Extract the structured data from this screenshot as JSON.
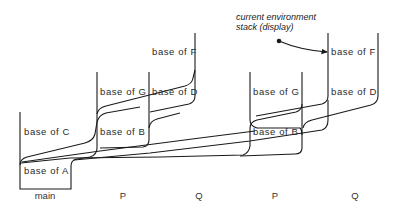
{
  "diagram": {
    "annotation": {
      "line1": "current environment",
      "line2": "stack (display)"
    },
    "columns": [
      {
        "label": "main",
        "frames": [
          "base of C",
          "base of A"
        ]
      },
      {
        "label": "P",
        "frames": [
          "base of G",
          "base of B"
        ]
      },
      {
        "label": "Q",
        "frames": [
          "base of F",
          "base of D"
        ]
      },
      {
        "label": "P",
        "frames": [
          "base of G",
          "base of B"
        ]
      },
      {
        "label": "Q",
        "frames": [
          "base of F",
          "base of D"
        ]
      }
    ],
    "colors": {
      "line": "#1a1a1a",
      "text": "#2a2a2a",
      "background": "#ffffff"
    }
  }
}
